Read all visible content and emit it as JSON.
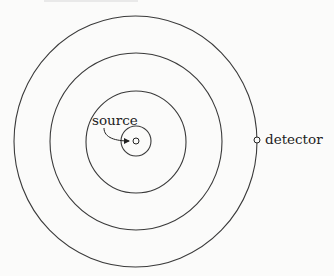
{
  "diagram": {
    "type": "concentric-wavefronts",
    "labels": {
      "source": "source",
      "detector": "detector"
    },
    "center": [
      136,
      141
    ],
    "rings": [
      {
        "rx": 15,
        "ry": 15
      },
      {
        "rx": 50,
        "ry": 51
      },
      {
        "rx": 86,
        "ry": 88
      },
      {
        "rx": 121.5,
        "ry": 125.5
      }
    ],
    "detector_position": [
      257,
      140
    ],
    "colors": {
      "stroke": "#3a3a3a",
      "background": "#fbfbfa"
    }
  }
}
